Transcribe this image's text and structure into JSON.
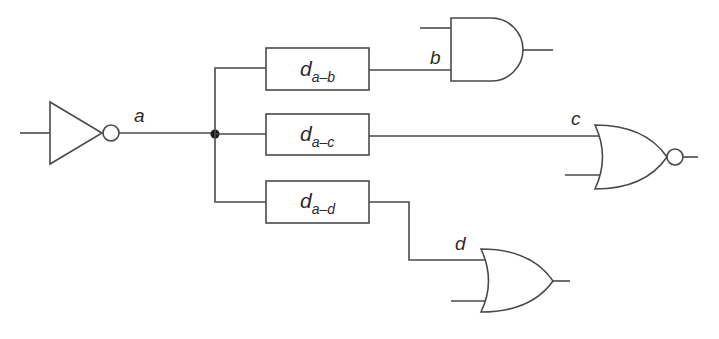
{
  "diagram": {
    "type": "logic-circuit",
    "colors": {
      "stroke": "#4a4a4a",
      "text": "#2a2a2a",
      "background": "#ffffff"
    },
    "signals": {
      "a": "a",
      "b": "b",
      "c": "c",
      "d": "d"
    },
    "delays": [
      {
        "main": "d",
        "sub": "a–b"
      },
      {
        "main": "d",
        "sub": "a–c"
      },
      {
        "main": "d",
        "sub": "a–d"
      }
    ],
    "gates": [
      {
        "type": "NOT",
        "output": "a"
      },
      {
        "type": "AND",
        "input": "b"
      },
      {
        "type": "NOR",
        "input": "c"
      },
      {
        "type": "OR",
        "input": "d"
      }
    ]
  }
}
